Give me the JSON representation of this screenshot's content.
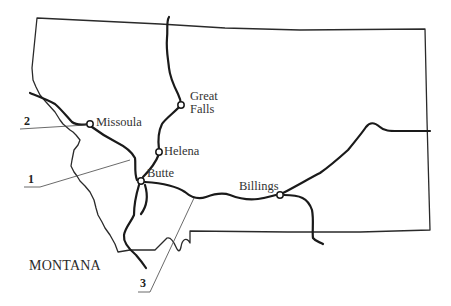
{
  "map": {
    "state_label": "MONTANA",
    "cities": [
      {
        "name": "Missoula",
        "x": 90,
        "y": 124
      },
      {
        "name": "Great\nFalls",
        "line1": "Great",
        "line2": "Falls",
        "x": 181,
        "y": 105
      },
      {
        "name": "Helena",
        "x": 159,
        "y": 152
      },
      {
        "name": "Butte",
        "x": 141,
        "y": 181
      },
      {
        "name": "Billings",
        "x": 279,
        "y": 195
      }
    ],
    "callouts": [
      {
        "number": "1"
      },
      {
        "number": "2"
      },
      {
        "number": "3"
      }
    ],
    "colors": {
      "background": "#ffffff",
      "ink": "#1a1a1a"
    }
  }
}
